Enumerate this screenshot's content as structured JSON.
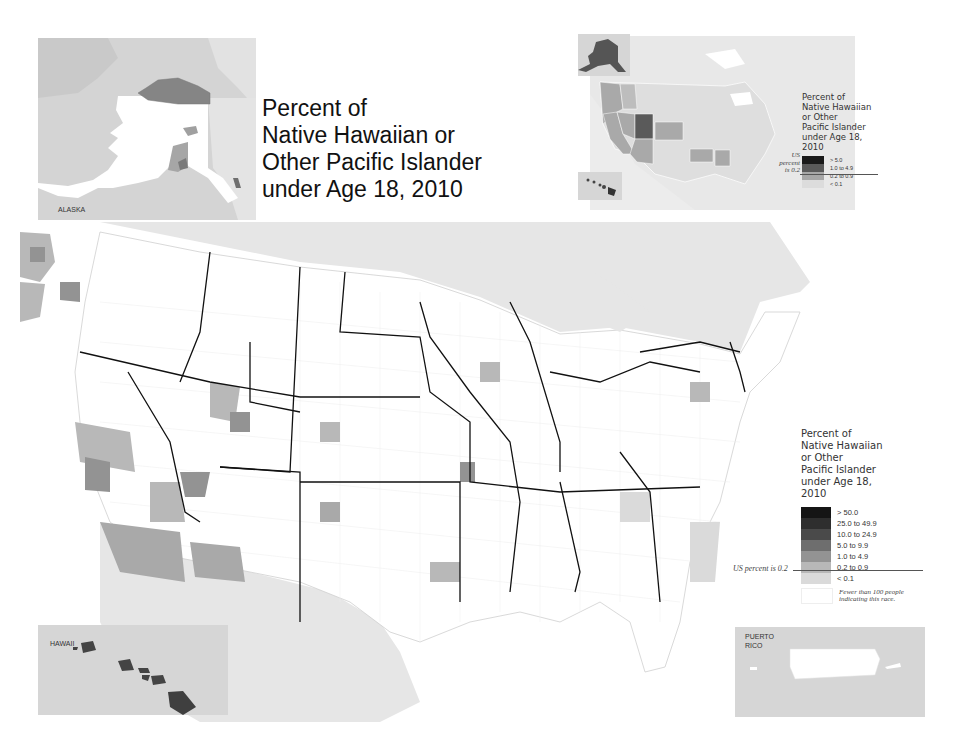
{
  "title": {
    "lines": [
      "Percent of",
      "Native Hawaiian or",
      "Other Pacific Islander",
      "under Age 18, 2010"
    ]
  },
  "insets": {
    "alaska": {
      "label": "ALASKA"
    },
    "hawaii": {
      "label": "HAWAII"
    },
    "puerto_rico": {
      "label_line1": "PUERTO",
      "label_line2": "RICO"
    }
  },
  "state_level_map": {
    "legend": {
      "title_lines": [
        "Percent of",
        "Native Hawaiian",
        "or Other",
        "Pacific Islander",
        "under Age 18,",
        "2010"
      ],
      "us_note_lines": [
        "US",
        "percent",
        "is 0.2"
      ],
      "classes": [
        {
          "label": "> 5.0",
          "color": "#1a1a1a"
        },
        {
          "label": "1.0 to 4.9",
          "color": "#5a5a5a"
        },
        {
          "label": "0.2 to 0.9",
          "color": "#a6a6a6"
        },
        {
          "label": "< 0.1",
          "color": "#dcdcdc"
        }
      ]
    }
  },
  "county_map": {
    "legend": {
      "title_lines": [
        "Percent of",
        "Native Hawaiian",
        "or Other",
        "Pacific Islander",
        "under Age 18,",
        "2010"
      ],
      "us_note": "US percent is 0.2",
      "classes": [
        {
          "label": "> 50.0",
          "color": "#151515"
        },
        {
          "label": "25.0 to 49.9",
          "color": "#2e2e2e"
        },
        {
          "label": "10.0 to 24.9",
          "color": "#4a4a4a"
        },
        {
          "label": "5.0 to 9.9",
          "color": "#6e6e6e"
        },
        {
          "label": "1.0 to 4.9",
          "color": "#939393"
        },
        {
          "label": "0.2 to 0.9",
          "color": "#b8b8b8"
        },
        {
          "label": "< 0.1",
          "color": "#dadada"
        },
        {
          "label": "Fewer than 100 people indicating this race.",
          "color": "#ffffff",
          "label_line1": "Fewer than 100 people",
          "label_line2": "indicating this race."
        }
      ]
    }
  },
  "colors": {
    "background": "#ffffff",
    "neighbor_land": "#e6e6e6",
    "inset_bg": "#d9d9d9",
    "state_border": "#111111",
    "county_fill_default": "#ffffff"
  }
}
